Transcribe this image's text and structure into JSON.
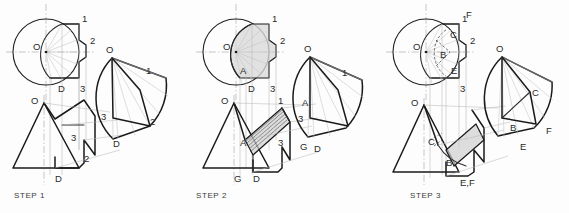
{
  "drawing": {
    "title": "Cone development construction sequence",
    "background_color": "#fdfdfd",
    "line_color": "#1a1a1a",
    "shade_color": "#d9d9d9",
    "projection_color": "#b9b9b9"
  },
  "steps": [
    {
      "id": "step-1",
      "caption": "STEP 1",
      "views": {
        "top": {
          "center_label": "O",
          "labels": [
            "1",
            "2",
            "3",
            "D"
          ]
        },
        "front": {
          "apex_label": "O",
          "labels": [
            "2",
            "3",
            "D"
          ]
        },
        "development": {
          "apex_label": "O",
          "labels": [
            "1",
            "2",
            "3",
            "D"
          ]
        }
      }
    },
    {
      "id": "step-2",
      "caption": "STEP 2",
      "views": {
        "top": {
          "center_label": "O",
          "labels": [
            "1",
            "2",
            "3",
            "A",
            "D"
          ]
        },
        "front": {
          "apex_label": "O",
          "labels": [
            "1",
            "3",
            "A",
            "G",
            "D"
          ]
        },
        "development": {
          "apex_label": "O",
          "labels": [
            "1",
            "3",
            "A",
            "G",
            "D"
          ]
        }
      }
    },
    {
      "id": "step-3",
      "caption": "STEP 3",
      "views": {
        "top": {
          "center_label": "O",
          "labels": [
            "1",
            "2",
            "3",
            "B",
            "C",
            "E",
            "F"
          ]
        },
        "front": {
          "apex_label": "O",
          "labels": [
            "B",
            "C",
            "E,F"
          ]
        },
        "development": {
          "apex_label": "O",
          "labels": [
            "B",
            "C",
            "E",
            "F"
          ]
        }
      }
    }
  ],
  "step1": {
    "top_O": "O",
    "top_1": "1",
    "top_2": "2",
    "top_3": "3",
    "top_D": "D",
    "front_O": "O",
    "front_2": "2",
    "front_3": "3",
    "front_D": "D",
    "dev_O": "O",
    "dev_1": "1",
    "dev_2": "2",
    "dev_3": "3",
    "dev_D": "D",
    "caption": "STEP 1"
  },
  "step2": {
    "top_O": "O",
    "top_1": "1",
    "top_2": "2",
    "top_3": "3",
    "top_A": "A",
    "top_D": "D",
    "front_O": "O",
    "front_1": "1",
    "front_3": "3",
    "front_A": "A",
    "front_G": "G",
    "front_D": "D",
    "dev_O": "O",
    "dev_1": "1",
    "dev_3": "3",
    "dev_A": "A",
    "dev_G": "G",
    "dev_D": "D",
    "caption": "STEP 2"
  },
  "step3": {
    "top_O": "O",
    "top_1": "1",
    "top_2": "2",
    "top_3": "3",
    "top_B": "B",
    "top_C": "C",
    "top_E": "E",
    "top_F": "F",
    "front_O": "O",
    "front_B": "B",
    "front_C": "C",
    "front_EF": "E,F",
    "dev_O": "O",
    "dev_B": "B",
    "dev_C": "C",
    "dev_E": "E",
    "dev_F": "F",
    "caption": "STEP 3"
  }
}
